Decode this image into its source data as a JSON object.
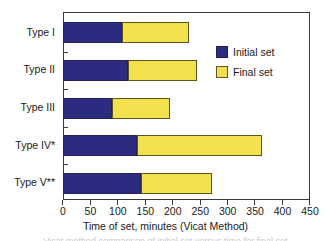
{
  "chart_data": {
    "type": "bar",
    "orientation": "horizontal",
    "stacked": true,
    "title": "",
    "xlabel": "Time of set, minutes (Vicat Method)",
    "ylabel": "",
    "xlim": [
      0,
      450
    ],
    "ylim": null,
    "grid": false,
    "legend_position": "upper right inside",
    "xticks": [
      0,
      50,
      100,
      150,
      200,
      250,
      300,
      350,
      400,
      450
    ],
    "xticklabels": [
      "0",
      "50",
      "100",
      "150",
      "200",
      "250",
      "300",
      "350",
      "400",
      "450"
    ],
    "categories": [
      "Type I",
      "Type II",
      "Type III",
      "Type IV*",
      "Type V**"
    ],
    "series": [
      {
        "name": "Initial set",
        "color": "#2b2b80",
        "values": [
          107,
          118,
          89,
          135,
          142
        ]
      },
      {
        "name": "Final set",
        "color": "#f2e04c",
        "values": [
          230,
          244,
          195,
          362,
          272
        ]
      }
    ],
    "annotations": []
  },
  "legend": {
    "entries": [
      {
        "label": "Initial set",
        "swatch": "initial"
      },
      {
        "label": "Final set",
        "swatch": "final"
      }
    ]
  },
  "axis": {
    "x_title": "Time of set, minutes (Vicat Method)"
  },
  "caption": {
    "sliver_text": "Vicat method comparison of initial set versus time for final set"
  },
  "colors": {
    "initial_set": "#2b2b80",
    "final_set": "#f2e04c",
    "frame": "#3a3a3a",
    "text": "#1a1a1a",
    "background": "#ffffff"
  }
}
